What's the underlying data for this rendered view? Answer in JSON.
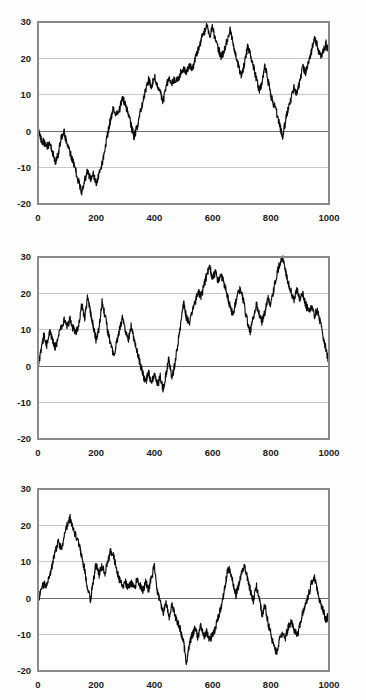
{
  "page": {
    "background_color": "#ffffff",
    "width": 366,
    "height": 700,
    "panel_count": 3
  },
  "style": {
    "series_color": "#0b0b0b",
    "gridline_color": "#b9b9b9",
    "zeroline_color": "#6d6d6d",
    "frame_color": "#8a8a8a",
    "tick_label_color": "#1a1a1a"
  },
  "chart_data": [
    {
      "type": "line",
      "title": "",
      "subtitle": "",
      "xlabel": "",
      "ylabel": "",
      "xlim": [
        0,
        1000
      ],
      "ylim": [
        -20,
        30
      ],
      "xticks": [
        0,
        200,
        400,
        600,
        800,
        1000
      ],
      "yticks": [
        -20,
        -10,
        0,
        10,
        20,
        30
      ],
      "xtick_labels": [
        "0",
        "200",
        "400",
        "600",
        "800",
        "1000"
      ],
      "ytick_labels": [
        "-20",
        "-10",
        "0",
        "10",
        "20",
        "30"
      ],
      "grid": true,
      "legend": false,
      "legend_position": "none",
      "zero_reference_line": 0,
      "series": [
        {
          "name": "series-1",
          "x_start": 0,
          "x_step": 10,
          "note": "random-walk; values sampled every 10 steps from 0 to 1000",
          "values": [
            0.5,
            -2.2,
            -3.0,
            -4.5,
            -3.2,
            -5.8,
            -8.5,
            -6.0,
            -1.5,
            -0.5,
            -3.5,
            -6.0,
            -8.2,
            -11.0,
            -14.0,
            -16.5,
            -13.5,
            -11.0,
            -13.0,
            -12.0,
            -14.5,
            -11.5,
            -9.0,
            -5.0,
            -0.5,
            3.5,
            6.5,
            4.5,
            6.0,
            9.0,
            7.5,
            5.0,
            1.5,
            -1.5,
            1.0,
            4.5,
            8.0,
            11.5,
            14.0,
            12.5,
            15.0,
            13.0,
            10.5,
            8.0,
            12.0,
            15.0,
            13.0,
            14.5,
            14.0,
            16.0,
            17.5,
            16.0,
            18.0,
            17.0,
            20.0,
            22.5,
            25.0,
            27.0,
            29.0,
            26.0,
            28.5,
            25.0,
            22.5,
            20.5,
            22.0,
            25.0,
            28.0,
            24.0,
            21.0,
            17.5,
            15.0,
            19.0,
            23.0,
            21.0,
            18.0,
            14.5,
            11.0,
            13.5,
            18.0,
            14.0,
            10.0,
            7.5,
            5.0,
            2.0,
            -1.5,
            2.5,
            6.5,
            9.0,
            12.0,
            10.0,
            14.0,
            17.5,
            16.0,
            19.0,
            22.0,
            25.5,
            23.5,
            20.5,
            22.0,
            24.0,
            21.5
          ]
        }
      ]
    },
    {
      "type": "line",
      "title": "",
      "subtitle": "",
      "xlabel": "",
      "ylabel": "",
      "xlim": [
        0,
        1000
      ],
      "ylim": [
        -20,
        30
      ],
      "xticks": [
        0,
        200,
        400,
        600,
        800,
        1000
      ],
      "yticks": [
        -20,
        -10,
        0,
        10,
        20,
        30
      ],
      "xtick_labels": [
        "0",
        "200",
        "400",
        "600",
        "800",
        "1000"
      ],
      "ytick_labels": [
        "-20",
        "-10",
        "0",
        "10",
        "20",
        "30"
      ],
      "grid": true,
      "legend": false,
      "legend_position": "none",
      "zero_reference_line": 0,
      "series": [
        {
          "name": "series-2",
          "x_start": 0,
          "x_step": 10,
          "note": "random-walk; values sampled every 10 steps from 0 to 1000",
          "values": [
            -0.5,
            4.0,
            8.5,
            6.0,
            9.5,
            7.0,
            5.0,
            8.0,
            10.5,
            12.5,
            11.0,
            13.0,
            10.5,
            9.0,
            11.0,
            17.0,
            13.0,
            19.0,
            15.0,
            11.0,
            7.0,
            10.5,
            17.5,
            14.0,
            9.5,
            6.0,
            3.0,
            6.5,
            10.0,
            13.0,
            10.0,
            7.0,
            11.0,
            7.5,
            4.0,
            1.0,
            -2.0,
            -4.5,
            -1.5,
            -5.0,
            -2.0,
            -5.5,
            -3.0,
            -6.5,
            -2.0,
            2.0,
            -3.5,
            0.5,
            6.0,
            11.0,
            17.5,
            13.5,
            11.5,
            15.0,
            17.5,
            20.5,
            19.0,
            22.0,
            25.0,
            27.5,
            24.0,
            26.0,
            23.0,
            25.0,
            22.5,
            19.5,
            16.5,
            14.0,
            18.0,
            21.0,
            20.5,
            16.0,
            12.0,
            9.5,
            13.5,
            17.0,
            14.5,
            12.0,
            15.0,
            19.0,
            17.0,
            21.0,
            25.0,
            28.0,
            30.0,
            26.0,
            23.0,
            20.5,
            18.0,
            21.0,
            18.5,
            20.0,
            17.0,
            15.0,
            16.5,
            14.0,
            15.5,
            12.0,
            8.0,
            4.5,
            1.0
          ]
        }
      ]
    },
    {
      "type": "line",
      "title": "",
      "subtitle": "",
      "xlabel": "",
      "ylabel": "",
      "xlim": [
        0,
        1000
      ],
      "ylim": [
        -20,
        30
      ],
      "xticks": [
        0,
        200,
        400,
        600,
        800,
        1000
      ],
      "yticks": [
        -20,
        -10,
        0,
        10,
        20,
        30
      ],
      "xtick_labels": [
        "0",
        "200",
        "400",
        "600",
        "800",
        "1000"
      ],
      "ytick_labels": [
        "-20",
        "-10",
        "0",
        "10",
        "20",
        "30"
      ],
      "grid": true,
      "legend": false,
      "legend_position": "none",
      "zero_reference_line": 0,
      "series": [
        {
          "name": "series-3",
          "x_start": 0,
          "x_step": 10,
          "note": "random-walk; values sampled every 10 steps from 0 to 1000",
          "values": [
            -1.0,
            2.0,
            4.0,
            3.0,
            6.0,
            9.5,
            13.0,
            15.5,
            13.5,
            17.0,
            20.0,
            22.0,
            19.5,
            17.0,
            15.0,
            11.5,
            8.0,
            3.0,
            -0.5,
            4.5,
            9.5,
            6.5,
            9.0,
            7.0,
            10.0,
            13.0,
            11.5,
            8.0,
            5.0,
            3.5,
            4.5,
            3.0,
            4.5,
            2.5,
            5.0,
            3.5,
            2.0,
            4.5,
            2.5,
            5.5,
            9.0,
            2.0,
            -1.0,
            -4.0,
            -1.5,
            -5.5,
            -2.0,
            -4.5,
            -6.5,
            -9.0,
            -12.0,
            -17.5,
            -13.0,
            -10.0,
            -8.5,
            -11.0,
            -7.5,
            -10.5,
            -9.0,
            -11.5,
            -10.0,
            -8.0,
            -5.0,
            -2.0,
            2.0,
            7.0,
            8.0,
            4.0,
            1.0,
            3.5,
            7.0,
            9.0,
            5.5,
            2.0,
            -0.5,
            3.5,
            0.0,
            -4.5,
            -2.0,
            -6.5,
            -10.0,
            -13.0,
            -15.0,
            -11.5,
            -9.5,
            -11.0,
            -8.0,
            -6.5,
            -8.5,
            -10.5,
            -7.5,
            -4.0,
            -1.5,
            1.0,
            4.0,
            6.0,
            2.0,
            -1.0,
            -3.5,
            -6.0,
            -4.5
          ]
        }
      ]
    }
  ]
}
